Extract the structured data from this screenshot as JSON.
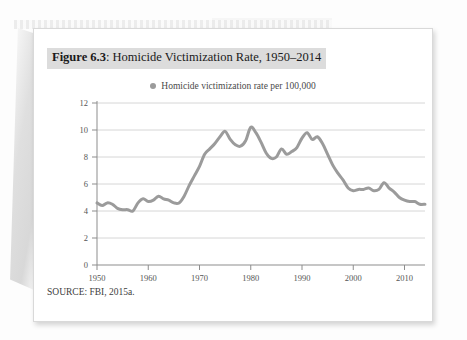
{
  "figure": {
    "number_label": "Figure 6.3",
    "separator": ": ",
    "title_text": "Homicide Victimization Rate, 1950–2014",
    "full_title": "Figure 6.3: Homicide Victimization Rate, 1950–2014",
    "source_note": "SOURCE: FBI, 2015a.",
    "legend_label": "Homicide victimization rate per 100,000",
    "series_color": "#9b9b9b",
    "grid_color": "#d6d6d6",
    "axis_color": "#8d8d8d",
    "title_highlight_color": "#dcdcdc"
  },
  "chart_data": {
    "type": "line",
    "title": "Homicide Victimization Rate, 1950–2014",
    "subtitle": "",
    "xlabel": "",
    "ylabel": "",
    "xlim": [
      1950,
      2014
    ],
    "ylim": [
      0,
      12
    ],
    "grid": "horizontal",
    "legend_position": "top-center",
    "xticks": [
      1950,
      1960,
      1970,
      1980,
      1990,
      2000,
      2010
    ],
    "xtick_labels": [
      "1950",
      "1960",
      "1970",
      "1980",
      "1990",
      "2000",
      "2010"
    ],
    "yticks": [
      0,
      2,
      4,
      6,
      8,
      10,
      12
    ],
    "ytick_labels": [
      "0",
      "2",
      "4",
      "6",
      "8",
      "10",
      "12"
    ],
    "series": [
      {
        "name": "Homicide victimization rate per 100,000",
        "color": "#9b9b9b",
        "x": [
          1950,
          1951,
          1952,
          1953,
          1954,
          1955,
          1956,
          1957,
          1958,
          1959,
          1960,
          1961,
          1962,
          1963,
          1964,
          1965,
          1966,
          1967,
          1968,
          1969,
          1970,
          1971,
          1972,
          1973,
          1974,
          1975,
          1976,
          1977,
          1978,
          1979,
          1980,
          1981,
          1982,
          1983,
          1984,
          1985,
          1986,
          1987,
          1988,
          1989,
          1990,
          1991,
          1992,
          1993,
          1994,
          1995,
          1996,
          1997,
          1998,
          1999,
          2000,
          2001,
          2002,
          2003,
          2004,
          2005,
          2006,
          2007,
          2008,
          2009,
          2010,
          2011,
          2012,
          2013,
          2014
        ],
        "values": [
          4.6,
          4.4,
          4.6,
          4.5,
          4.2,
          4.1,
          4.1,
          4.0,
          4.6,
          4.9,
          4.7,
          4.8,
          5.1,
          4.9,
          4.8,
          4.6,
          4.6,
          5.1,
          5.9,
          6.6,
          7.3,
          8.2,
          8.6,
          9.0,
          9.5,
          9.9,
          9.3,
          8.9,
          8.8,
          9.2,
          10.2,
          9.8,
          9.1,
          8.3,
          7.9,
          8.0,
          8.6,
          8.2,
          8.4,
          8.7,
          9.4,
          9.8,
          9.3,
          9.5,
          9.0,
          8.2,
          7.4,
          6.8,
          6.3,
          5.7,
          5.5,
          5.6,
          5.6,
          5.7,
          5.5,
          5.6,
          6.1,
          5.7,
          5.4,
          5.0,
          4.8,
          4.7,
          4.7,
          4.5,
          4.5
        ]
      }
    ]
  }
}
